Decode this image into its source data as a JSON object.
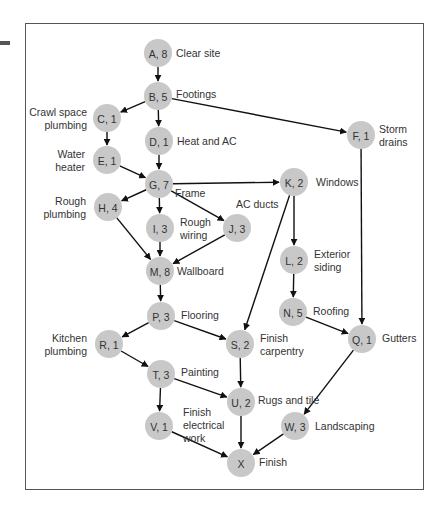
{
  "diagram": {
    "type": "activity-on-node network",
    "colors": {
      "node_fill": "#c8c8c8",
      "edge": "#111111",
      "text": "#333333",
      "frame": "#555555"
    },
    "nodes": [
      {
        "id": "A",
        "label": "A, 8",
        "duration": 8,
        "desc": [
          "Clear site"
        ],
        "x": 158,
        "y": 53,
        "dx": 18,
        "dy": 0,
        "anchor": "start"
      },
      {
        "id": "B",
        "label": "B, 5",
        "duration": 5,
        "desc": [
          "Footings"
        ],
        "x": 158,
        "y": 96,
        "dx": 18,
        "dy": -2,
        "anchor": "start"
      },
      {
        "id": "C",
        "label": "C, 1",
        "duration": 1,
        "desc": [
          "Crawl space",
          "plumbing"
        ],
        "x": 107,
        "y": 118,
        "dx": -20,
        "dy": -6,
        "anchor": "end"
      },
      {
        "id": "D",
        "label": "D, 1",
        "duration": 1,
        "desc": [
          "Heat and AC"
        ],
        "x": 159,
        "y": 141,
        "dx": 18,
        "dy": 0,
        "anchor": "start"
      },
      {
        "id": "E",
        "label": "E, 1",
        "duration": 1,
        "desc": [
          "Water",
          "heater"
        ],
        "x": 107,
        "y": 160,
        "dx": -22,
        "dy": -6,
        "anchor": "end"
      },
      {
        "id": "F",
        "label": "F, 1",
        "duration": 1,
        "desc": [
          "Storm",
          "drains"
        ],
        "x": 361,
        "y": 135,
        "dx": 18,
        "dy": -6,
        "anchor": "start"
      },
      {
        "id": "G",
        "label": "G, 7",
        "duration": 7,
        "desc": [
          "Frame"
        ],
        "x": 159,
        "y": 184,
        "dx": 16,
        "dy": 9,
        "anchor": "start"
      },
      {
        "id": "H",
        "label": "H, 4",
        "duration": 4,
        "desc": [
          "Rough",
          "plumbing"
        ],
        "x": 108,
        "y": 207,
        "dx": -22,
        "dy": -6,
        "anchor": "end"
      },
      {
        "id": "I",
        "label": "I, 3",
        "duration": 3,
        "desc": [
          "Rough",
          "wiring"
        ],
        "x": 160,
        "y": 228,
        "dx": 20,
        "dy": -6,
        "anchor": "start"
      },
      {
        "id": "J",
        "label": "J, 3",
        "duration": 3,
        "desc": [
          "AC ducts"
        ],
        "x": 237,
        "y": 228,
        "dx": -1,
        "dy": -24,
        "anchor": "start"
      },
      {
        "id": "K",
        "label": "K, 2",
        "duration": 2,
        "desc": [
          "Windows"
        ],
        "x": 294,
        "y": 182,
        "dx": 22,
        "dy": 0,
        "anchor": "start"
      },
      {
        "id": "L",
        "label": "L, 2",
        "duration": 2,
        "desc": [
          "Exterior",
          "siding"
        ],
        "x": 294,
        "y": 260,
        "dx": 20,
        "dy": -6,
        "anchor": "start"
      },
      {
        "id": "M",
        "label": "M, 8",
        "duration": 8,
        "desc": [
          "Wallboard"
        ],
        "x": 160,
        "y": 271,
        "dx": 17,
        "dy": 0,
        "anchor": "start"
      },
      {
        "id": "N",
        "label": "N, 5",
        "duration": 5,
        "desc": [
          "Roofing"
        ],
        "x": 293,
        "y": 312,
        "dx": 20,
        "dy": -1,
        "anchor": "start"
      },
      {
        "id": "P",
        "label": "P, 3",
        "duration": 3,
        "desc": [
          "Flooring"
        ],
        "x": 161,
        "y": 316,
        "dx": 20,
        "dy": -1,
        "anchor": "start"
      },
      {
        "id": "Q",
        "label": "Q, 1",
        "duration": 1,
        "desc": [
          "Gutters"
        ],
        "x": 362,
        "y": 339,
        "dx": 20,
        "dy": -1,
        "anchor": "start"
      },
      {
        "id": "R",
        "label": "R, 1",
        "duration": 1,
        "desc": [
          "Kitchen",
          "plumbing"
        ],
        "x": 109,
        "y": 344,
        "dx": -22,
        "dy": -6,
        "anchor": "end"
      },
      {
        "id": "S",
        "label": "S, 2",
        "duration": 2,
        "desc": [
          "Finish",
          "carpentry"
        ],
        "x": 240,
        "y": 344,
        "dx": 20,
        "dy": -6,
        "anchor": "start"
      },
      {
        "id": "T",
        "label": "T, 3",
        "duration": 3,
        "desc": [
          "Painting"
        ],
        "x": 161,
        "y": 374,
        "dx": 20,
        "dy": -2,
        "anchor": "start"
      },
      {
        "id": "U",
        "label": "U, 2",
        "duration": 2,
        "desc": [
          "Rugs and tile"
        ],
        "x": 241,
        "y": 402,
        "dx": 17,
        "dy": -2,
        "anchor": "start"
      },
      {
        "id": "V",
        "label": "V, 1",
        "duration": 1,
        "desc": [
          "Finish",
          "electrical",
          "work"
        ],
        "x": 159,
        "y": 426,
        "dx": 24,
        "dy": -14,
        "anchor": "start"
      },
      {
        "id": "W",
        "label": "W, 3",
        "duration": 3,
        "desc": [
          "Landscaping"
        ],
        "x": 295,
        "y": 426,
        "dx": 20,
        "dy": 0,
        "anchor": "start"
      },
      {
        "id": "X",
        "label": "X",
        "duration": null,
        "desc": [
          "Finish"
        ],
        "x": 241,
        "y": 463,
        "dx": 18,
        "dy": -1,
        "anchor": "start"
      }
    ],
    "edges": [
      [
        "A",
        "B"
      ],
      [
        "B",
        "C"
      ],
      [
        "B",
        "D"
      ],
      [
        "B",
        "F"
      ],
      [
        "C",
        "E"
      ],
      [
        "D",
        "G"
      ],
      [
        "E",
        "G"
      ],
      [
        "G",
        "H"
      ],
      [
        "G",
        "I"
      ],
      [
        "G",
        "J"
      ],
      [
        "G",
        "K"
      ],
      [
        "H",
        "M"
      ],
      [
        "I",
        "M"
      ],
      [
        "J",
        "M"
      ],
      [
        "K",
        "L"
      ],
      [
        "K",
        "S"
      ],
      [
        "L",
        "N"
      ],
      [
        "N",
        "Q"
      ],
      [
        "F",
        "Q"
      ],
      [
        "M",
        "P"
      ],
      [
        "P",
        "R"
      ],
      [
        "P",
        "S"
      ],
      [
        "R",
        "T"
      ],
      [
        "S",
        "U"
      ],
      [
        "T",
        "U"
      ],
      [
        "T",
        "V"
      ],
      [
        "U",
        "X"
      ],
      [
        "V",
        "X"
      ],
      [
        "Q",
        "W"
      ],
      [
        "W",
        "X"
      ]
    ]
  }
}
